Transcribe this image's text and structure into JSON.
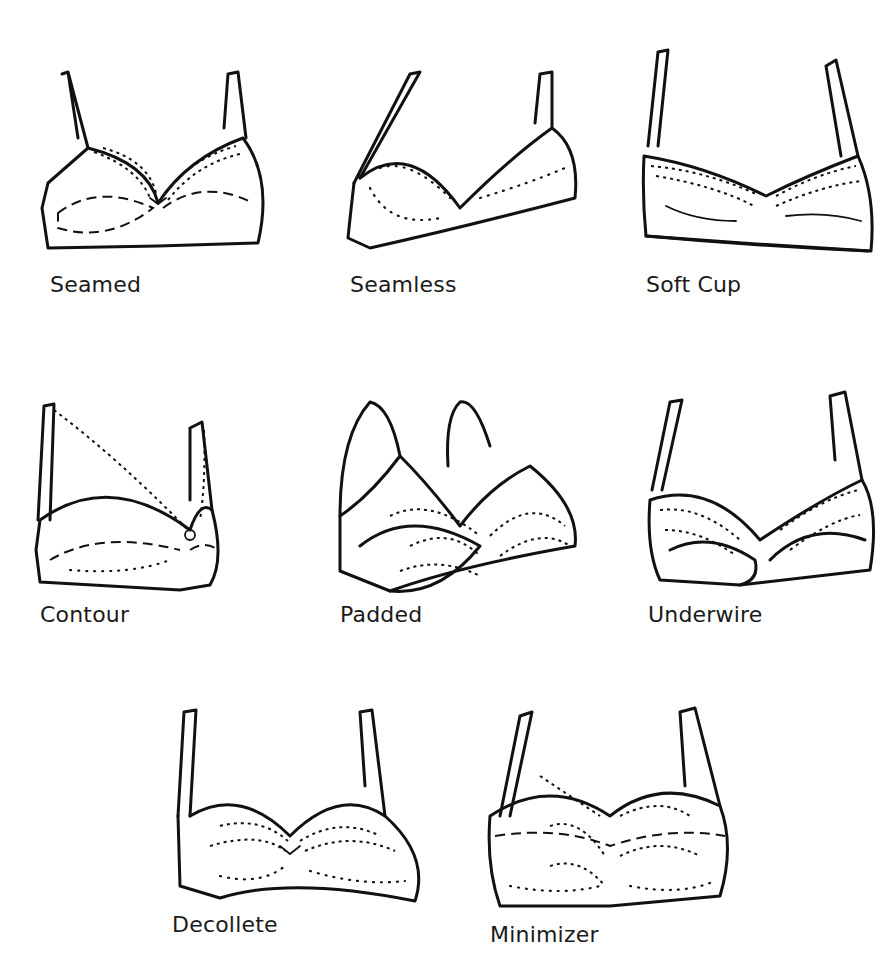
{
  "figure": {
    "items": [
      {
        "id": "seamed",
        "label": "Seamed",
        "icon": "seamed-bra-icon"
      },
      {
        "id": "seamless",
        "label": "Seamless",
        "icon": "seamless-bra-icon"
      },
      {
        "id": "soft-cup",
        "label": "Soft Cup",
        "icon": "soft-cup-bra-icon"
      },
      {
        "id": "contour",
        "label": "Contour",
        "icon": "contour-bra-icon"
      },
      {
        "id": "padded",
        "label": "Padded",
        "icon": "padded-bra-icon"
      },
      {
        "id": "underwire",
        "label": "Underwire",
        "icon": "underwire-bra-icon"
      },
      {
        "id": "decollete",
        "label": "Decollete",
        "icon": "decollete-bra-icon"
      },
      {
        "id": "minimizer",
        "label": "Minimizer",
        "icon": "minimizer-bra-icon"
      }
    ]
  }
}
